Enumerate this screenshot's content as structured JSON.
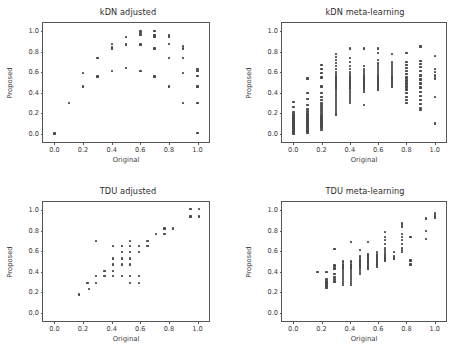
{
  "figure": {
    "background_color": "#ffffff",
    "marker_color": "#4a4a4a",
    "axis_color": "#555555",
    "text_color": "#3a3a3a"
  },
  "axis": {
    "xlabel": "Original",
    "ylabel": "Proposed",
    "xticks": [
      "0.0",
      "0.2",
      "0.4",
      "0.6",
      "0.8",
      "1.0"
    ],
    "yticks": [
      "0.0",
      "0.2",
      "0.4",
      "0.6",
      "0.8",
      "1.0"
    ]
  },
  "chart_data": [
    {
      "type": "scatter",
      "panel": "top-left",
      "title": "kDN adjusted",
      "xlabel": "Original",
      "ylabel": "Proposed",
      "xlim": [
        -0.08,
        1.08
      ],
      "ylim": [
        -0.08,
        1.08
      ],
      "xticks": [
        0.0,
        0.2,
        0.4,
        0.6,
        0.8,
        1.0
      ],
      "yticks": [
        0.0,
        0.2,
        0.4,
        0.6,
        0.8,
        1.0
      ],
      "grid": false,
      "legend": null,
      "points": [
        [
          0.0,
          0.0
        ],
        [
          0.0,
          0.005
        ],
        [
          0.1,
          0.3
        ],
        [
          0.2,
          0.59
        ],
        [
          0.2,
          0.46
        ],
        [
          0.3,
          0.74
        ],
        [
          0.3,
          0.56
        ],
        [
          0.4,
          0.875
        ],
        [
          0.4,
          0.845
        ],
        [
          0.4,
          0.83
        ],
        [
          0.4,
          0.615
        ],
        [
          0.5,
          0.945
        ],
        [
          0.5,
          0.87
        ],
        [
          0.5,
          0.64
        ],
        [
          0.6,
          1.0
        ],
        [
          0.6,
          0.985
        ],
        [
          0.6,
          0.965
        ],
        [
          0.6,
          0.87
        ],
        [
          0.6,
          0.615
        ],
        [
          0.7,
          1.0
        ],
        [
          0.7,
          0.96
        ],
        [
          0.7,
          0.945
        ],
        [
          0.7,
          0.83
        ],
        [
          0.7,
          0.56
        ],
        [
          0.8,
          0.965
        ],
        [
          0.8,
          0.95
        ],
        [
          0.8,
          0.875
        ],
        [
          0.8,
          0.74
        ],
        [
          0.8,
          0.46
        ],
        [
          0.9,
          0.855
        ],
        [
          0.9,
          0.83
        ],
        [
          0.9,
          0.74
        ],
        [
          0.9,
          0.59
        ],
        [
          0.9,
          0.3
        ],
        [
          1.0,
          0.63
        ],
        [
          1.0,
          0.61
        ],
        [
          1.0,
          0.565
        ],
        [
          1.0,
          0.46
        ],
        [
          1.0,
          0.3
        ],
        [
          1.0,
          0.01
        ]
      ]
    },
    {
      "type": "scatter",
      "panel": "top-right",
      "title": "kDN meta-learning",
      "xlabel": "Original",
      "ylabel": "Proposed",
      "xlim": [
        -0.08,
        1.08
      ],
      "ylim": [
        -0.08,
        1.08
      ],
      "xticks": [
        0.0,
        0.2,
        0.4,
        0.6,
        0.8,
        1.0
      ],
      "yticks": [
        0.0,
        0.2,
        0.4,
        0.6,
        0.8,
        1.0
      ],
      "grid": false,
      "legend": null,
      "columns": [
        {
          "x": 0.0,
          "values": [
            0.31,
            0.26,
            0.21,
            0.19,
            0.17,
            0.15,
            0.13,
            0.12,
            0.11,
            0.1,
            0.09,
            0.08,
            0.07,
            0.06,
            0.05,
            0.04,
            0.03,
            0.02,
            0.01,
            0.0
          ]
        },
        {
          "x": 0.1,
          "values": [
            0.54,
            0.4,
            0.34,
            0.28,
            0.24,
            0.22,
            0.2,
            0.19,
            0.18,
            0.17,
            0.16,
            0.15,
            0.14,
            0.13,
            0.12,
            0.11,
            0.1,
            0.09,
            0.08,
            0.07,
            0.06,
            0.05,
            0.04,
            0.03,
            0.02,
            0.01
          ]
        },
        {
          "x": 0.2,
          "values": [
            0.67,
            0.63,
            0.59,
            0.55,
            0.46,
            0.4,
            0.36,
            0.33,
            0.3,
            0.28,
            0.26,
            0.24,
            0.22,
            0.2,
            0.18,
            0.16,
            0.14,
            0.12,
            0.1,
            0.08,
            0.06,
            0.04
          ]
        },
        {
          "x": 0.3,
          "values": [
            0.78,
            0.75,
            0.72,
            0.69,
            0.66,
            0.63,
            0.6,
            0.58,
            0.56,
            0.54,
            0.52,
            0.5,
            0.48,
            0.46,
            0.44,
            0.42,
            0.4,
            0.38,
            0.36,
            0.34,
            0.32,
            0.3,
            0.28,
            0.26,
            0.24,
            0.22,
            0.2,
            0.19
          ]
        },
        {
          "x": 0.4,
          "values": [
            0.83,
            0.74,
            0.7,
            0.66,
            0.63,
            0.6,
            0.58,
            0.56,
            0.54,
            0.52,
            0.5,
            0.48,
            0.46,
            0.44,
            0.42,
            0.4,
            0.38,
            0.36,
            0.34,
            0.32,
            0.3
          ]
        },
        {
          "x": 0.5,
          "values": [
            0.83,
            0.66,
            0.63,
            0.61,
            0.59,
            0.57,
            0.55,
            0.53,
            0.51,
            0.49,
            0.47,
            0.45,
            0.43,
            0.41,
            0.28
          ]
        },
        {
          "x": 0.6,
          "values": [
            0.83,
            0.79,
            0.72,
            0.69,
            0.67,
            0.65,
            0.63,
            0.61,
            0.59,
            0.57,
            0.55,
            0.53,
            0.51,
            0.49,
            0.47,
            0.45,
            0.43
          ]
        },
        {
          "x": 0.7,
          "values": [
            0.78,
            0.7,
            0.68,
            0.66,
            0.64,
            0.62,
            0.6,
            0.58,
            0.56,
            0.54,
            0.52,
            0.5,
            0.48,
            0.46
          ]
        },
        {
          "x": 0.8,
          "values": [
            0.79,
            0.7,
            0.67,
            0.64,
            0.61,
            0.58,
            0.55,
            0.52,
            0.49,
            0.46,
            0.43,
            0.4,
            0.36,
            0.33,
            0.3
          ]
        },
        {
          "x": 0.9,
          "values": [
            0.85,
            0.71,
            0.68,
            0.65,
            0.61,
            0.57,
            0.53,
            0.49,
            0.45,
            0.41,
            0.37,
            0.33,
            0.29,
            0.25,
            0.23
          ]
        },
        {
          "x": 1.0,
          "values": [
            0.76,
            0.63,
            0.6,
            0.57,
            0.54,
            0.36,
            0.1
          ]
        }
      ]
    },
    {
      "type": "scatter",
      "panel": "bottom-left",
      "title": "TDU adjusted",
      "xlabel": "Original",
      "ylabel": "Proposed",
      "xlim": [
        -0.08,
        1.08
      ],
      "ylim": [
        -0.08,
        1.08
      ],
      "xticks": [
        0.0,
        0.2,
        0.4,
        0.6,
        0.8,
        1.0
      ],
      "yticks": [
        0.0,
        0.2,
        0.4,
        0.6,
        0.8,
        1.0
      ],
      "grid": false,
      "legend": null,
      "points": [
        [
          0.17,
          0.18
        ],
        [
          0.23,
          0.29
        ],
        [
          0.24,
          0.23
        ],
        [
          0.29,
          0.7
        ],
        [
          0.29,
          0.36
        ],
        [
          0.29,
          0.29
        ],
        [
          0.35,
          0.41
        ],
        [
          0.35,
          0.36
        ],
        [
          0.41,
          0.47
        ],
        [
          0.41,
          0.41
        ],
        [
          0.41,
          0.36
        ],
        [
          0.41,
          0.53
        ],
        [
          0.41,
          0.65
        ],
        [
          0.47,
          0.65
        ],
        [
          0.47,
          0.59
        ],
        [
          0.47,
          0.53
        ],
        [
          0.47,
          0.47
        ],
        [
          0.47,
          0.36
        ],
        [
          0.53,
          0.7
        ],
        [
          0.53,
          0.65
        ],
        [
          0.53,
          0.59
        ],
        [
          0.53,
          0.53
        ],
        [
          0.53,
          0.47
        ],
        [
          0.53,
          0.36
        ],
        [
          0.53,
          0.29
        ],
        [
          0.59,
          0.65
        ],
        [
          0.59,
          0.59
        ],
        [
          0.59,
          0.36
        ],
        [
          0.59,
          0.29
        ],
        [
          0.65,
          0.7
        ],
        [
          0.65,
          0.65
        ],
        [
          0.71,
          0.77
        ],
        [
          0.77,
          0.82
        ],
        [
          0.77,
          0.77
        ],
        [
          0.83,
          0.82
        ],
        [
          0.95,
          1.01
        ],
        [
          0.95,
          0.94
        ],
        [
          1.01,
          1.01
        ],
        [
          1.01,
          0.94
        ]
      ]
    },
    {
      "type": "scatter",
      "panel": "bottom-right",
      "title": "TDU meta-learning",
      "xlabel": "Original",
      "ylabel": "Proposed",
      "xlim": [
        -0.08,
        1.08
      ],
      "ylim": [
        -0.08,
        1.08
      ],
      "xticks": [
        0.0,
        0.2,
        0.4,
        0.6,
        0.8,
        1.0
      ],
      "yticks": [
        0.0,
        0.2,
        0.4,
        0.6,
        0.8,
        1.0
      ],
      "grid": false,
      "legend": null,
      "columns": [
        {
          "x": 0.17,
          "values": [
            0.4
          ]
        },
        {
          "x": 0.235,
          "values": [
            0.4,
            0.33,
            0.31,
            0.3,
            0.29,
            0.28,
            0.27,
            0.26,
            0.25,
            0.24
          ]
        },
        {
          "x": 0.29,
          "values": [
            0.62,
            0.46,
            0.43,
            0.38,
            0.35,
            0.33,
            0.31,
            0.3
          ]
        },
        {
          "x": 0.35,
          "values": [
            0.5,
            0.47,
            0.45,
            0.43,
            0.41,
            0.39,
            0.37,
            0.35,
            0.33,
            0.31,
            0.29,
            0.27
          ]
        },
        {
          "x": 0.41,
          "values": [
            0.69,
            0.5,
            0.47,
            0.45,
            0.43,
            0.41,
            0.39,
            0.37,
            0.35,
            0.33,
            0.31,
            0.29,
            0.27
          ]
        },
        {
          "x": 0.47,
          "values": [
            0.61,
            0.55,
            0.52,
            0.5,
            0.48,
            0.46,
            0.44,
            0.42,
            0.4,
            0.38
          ]
        },
        {
          "x": 0.53,
          "values": [
            0.69,
            0.57,
            0.55,
            0.53,
            0.51,
            0.49,
            0.47,
            0.45,
            0.43
          ]
        },
        {
          "x": 0.59,
          "values": [
            0.59,
            0.57,
            0.55,
            0.53,
            0.51,
            0.49,
            0.47,
            0.45
          ]
        },
        {
          "x": 0.65,
          "values": [
            0.79,
            0.74,
            0.71,
            0.67,
            0.63,
            0.61,
            0.59,
            0.57,
            0.55,
            0.53,
            0.51
          ]
        },
        {
          "x": 0.71,
          "values": [
            0.59,
            0.55,
            0.53
          ]
        },
        {
          "x": 0.77,
          "values": [
            0.87,
            0.84,
            0.77,
            0.74,
            0.71,
            0.67,
            0.63,
            0.61,
            0.59
          ]
        },
        {
          "x": 0.83,
          "values": [
            0.74,
            0.51,
            0.47
          ]
        },
        {
          "x": 0.94,
          "values": [
            0.92,
            0.8,
            0.72
          ]
        },
        {
          "x": 1.0,
          "values": [
            0.97,
            0.95,
            0.93
          ]
        }
      ]
    }
  ]
}
